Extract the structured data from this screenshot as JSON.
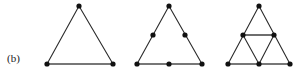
{
  "figure": {
    "label": "(b)",
    "background_color": "#ffffff",
    "line_color": "#2b2b2b",
    "base_line_color": "#4a4a4a",
    "dot_color": "#111111",
    "dot_radius": 2.6,
    "panels": [
      {
        "name": "triangle-order-0",
        "dot_count": 3,
        "vertices": [
          {
            "name": "apex",
            "x": 79,
            "y": 6
          },
          {
            "name": "bottom-left",
            "x": 47,
            "y": 64
          },
          {
            "name": "bottom-right",
            "x": 113,
            "y": 64
          }
        ],
        "edges": [
          {
            "name": "left-side",
            "x1": 79,
            "y1": 6,
            "x2": 47,
            "y2": 64,
            "style": "edge"
          },
          {
            "name": "right-side",
            "x1": 79,
            "y1": 6,
            "x2": 113,
            "y2": 64,
            "style": "edge"
          },
          {
            "name": "base",
            "x1": 47,
            "y1": 64,
            "x2": 113,
            "y2": 64,
            "style": "edge-base"
          }
        ]
      },
      {
        "name": "triangle-order-1-midpoints",
        "dot_count": 6,
        "vertices": [
          {
            "name": "apex",
            "x": 169,
            "y": 6
          },
          {
            "name": "bottom-left",
            "x": 137,
            "y": 64
          },
          {
            "name": "bottom-right",
            "x": 202,
            "y": 64
          },
          {
            "name": "left-midpoint",
            "x": 153,
            "y": 35
          },
          {
            "name": "right-midpoint",
            "x": 185,
            "y": 35
          },
          {
            "name": "base-midpoint",
            "x": 169,
            "y": 64
          }
        ],
        "edges": [
          {
            "name": "left-side",
            "x1": 169,
            "y1": 6,
            "x2": 137,
            "y2": 64,
            "style": "edge"
          },
          {
            "name": "right-side",
            "x1": 169,
            "y1": 6,
            "x2": 202,
            "y2": 64,
            "style": "edge"
          },
          {
            "name": "base",
            "x1": 137,
            "y1": 64,
            "x2": 202,
            "y2": 64,
            "style": "edge-base"
          }
        ]
      },
      {
        "name": "triangle-order-2-subdivided",
        "dot_count": 6,
        "vertices": [
          {
            "name": "apex",
            "x": 259,
            "y": 6
          },
          {
            "name": "bottom-left",
            "x": 228,
            "y": 64
          },
          {
            "name": "bottom-right",
            "x": 290,
            "y": 64
          },
          {
            "name": "left-midpoint",
            "x": 243,
            "y": 35
          },
          {
            "name": "right-midpoint",
            "x": 274,
            "y": 35
          },
          {
            "name": "base-midpoint",
            "x": 259,
            "y": 64
          }
        ],
        "edges": [
          {
            "name": "left-side",
            "x1": 259,
            "y1": 6,
            "x2": 228,
            "y2": 64,
            "style": "edge"
          },
          {
            "name": "right-side",
            "x1": 259,
            "y1": 6,
            "x2": 290,
            "y2": 64,
            "style": "edge"
          },
          {
            "name": "base",
            "x1": 228,
            "y1": 64,
            "x2": 290,
            "y2": 64,
            "style": "edge-base"
          },
          {
            "name": "midline-horizontal",
            "x1": 243,
            "y1": 35,
            "x2": 274,
            "y2": 35,
            "style": "edge-base"
          },
          {
            "name": "midline-left-to-basemid",
            "x1": 243,
            "y1": 35,
            "x2": 259,
            "y2": 64,
            "style": "edge"
          },
          {
            "name": "midline-right-to-basemid",
            "x1": 274,
            "y1": 35,
            "x2": 259,
            "y2": 64,
            "style": "edge"
          }
        ]
      }
    ]
  }
}
